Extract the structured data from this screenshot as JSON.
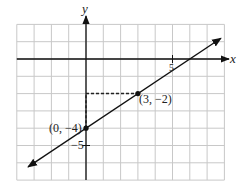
{
  "chart_data": {
    "type": "line",
    "title": "",
    "xlabel": "x",
    "ylabel": "y",
    "xlim": [
      -4,
      8
    ],
    "ylim": [
      -7,
      2
    ],
    "grid": true,
    "tick_labels": {
      "x": [
        {
          "value": 5,
          "label": "5"
        }
      ],
      "y": [
        {
          "value": -5,
          "label": "−5"
        }
      ]
    },
    "line": {
      "slope": 0.6667,
      "intercept": -4,
      "equation": "y = (2/3)x − 4",
      "x_start": -3.35,
      "x_end": 7.8,
      "arrows": "both"
    },
    "points": [
      {
        "x": 0,
        "y": -4,
        "label": "(0, −4)"
      },
      {
        "x": 3,
        "y": -2,
        "label": "(3, −2)"
      }
    ],
    "dashed_guides": [
      {
        "from": [
          0,
          -4
        ],
        "to": [
          0,
          -2
        ],
        "meaning": "rise 2"
      },
      {
        "from": [
          0,
          -2
        ],
        "to": [
          3,
          -2
        ],
        "meaning": "run 3"
      }
    ],
    "colors": {
      "grid": "#c8c8c8",
      "axes": "#111111",
      "line": "#111111"
    }
  },
  "labels": {
    "x_axis": "x",
    "y_axis": "y",
    "tick_x5": "5",
    "tick_y_neg5": "−5",
    "point_a": "(0, −4)",
    "point_b": "(3, −2)"
  }
}
